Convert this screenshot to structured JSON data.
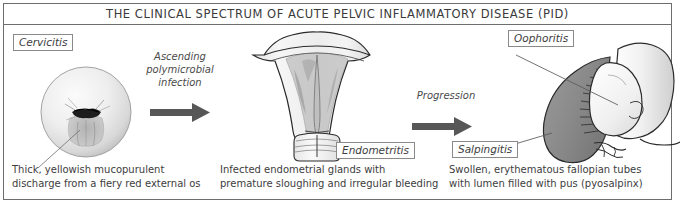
{
  "header": {
    "title": "THE CLINICAL SPECTRUM OF ACUTE PELVIC INFLAMMATORY DISEASE (PID)"
  },
  "stages": [
    {
      "label": "Cervicitis",
      "caption_line1": "Thick, yellowish mucopurulent",
      "caption_line2": "discharge from a fiery red external os",
      "figure": "cervix-speculum-view"
    },
    {
      "label": "Endometritis",
      "caption_line1": "Infected endometrial glands with",
      "caption_line2": "premature sloughing and irregular bleeding",
      "figure": "uterus-coronal-section"
    },
    {
      "labels": [
        "Oophoritis",
        "Salpingitis"
      ],
      "caption_line1": "Swollen, erythematous fallopian tubes",
      "caption_line2": "with lumen filled with pus (pyosalpinx)",
      "figure": "adnexa-pyosalpinx"
    }
  ],
  "transitions": [
    {
      "text_line1": "Ascending",
      "text_line2": "polymicrobial",
      "text_line3": "infection",
      "arrow": "right-arrow"
    },
    {
      "text_line1": "Progression",
      "arrow": "right-arrow"
    }
  ],
  "colors": {
    "border": "#6d6d6d",
    "arrow": "#575757",
    "text": "#3d3d3d",
    "inflamed_tube": "#8d8d8d",
    "endometrium": "#9a9a9a"
  }
}
